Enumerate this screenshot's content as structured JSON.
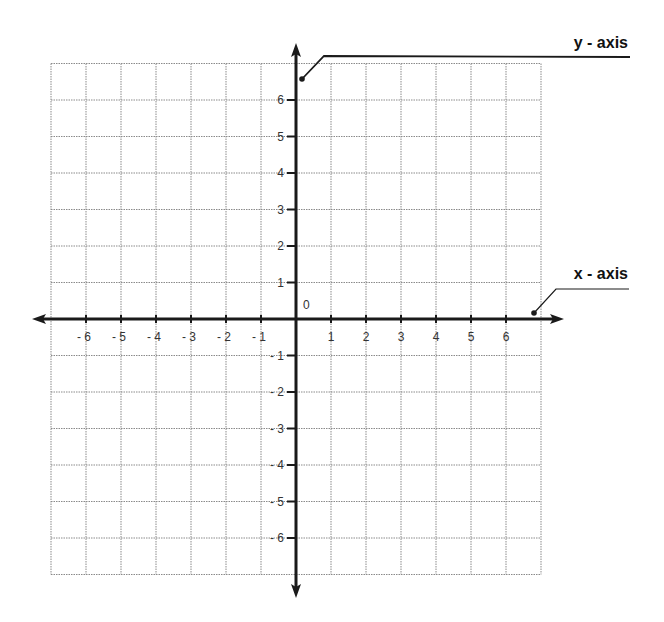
{
  "diagram": {
    "type": "coordinate-plane",
    "colors": {
      "grid": "#8a8a8a",
      "axis": "#1a1a1a",
      "text": "#333333",
      "background": "#ffffff"
    },
    "origin_label": "0",
    "x_axis": {
      "label": "x - axis",
      "ticks": [
        {
          "value": -6,
          "label": "- 6"
        },
        {
          "value": -5,
          "label": "- 5"
        },
        {
          "value": -4,
          "label": "- 4"
        },
        {
          "value": -3,
          "label": "- 3"
        },
        {
          "value": -2,
          "label": "- 2"
        },
        {
          "value": -1,
          "label": "- 1"
        },
        {
          "value": 1,
          "label": "1"
        },
        {
          "value": 2,
          "label": "2"
        },
        {
          "value": 3,
          "label": "3"
        },
        {
          "value": 4,
          "label": "4"
        },
        {
          "value": 5,
          "label": "5"
        },
        {
          "value": 6,
          "label": "6"
        }
      ],
      "range": [
        -7,
        7
      ]
    },
    "y_axis": {
      "label": "y - axis",
      "ticks": [
        {
          "value": 6,
          "label": "6"
        },
        {
          "value": 5,
          "label": "5"
        },
        {
          "value": 4,
          "label": "4"
        },
        {
          "value": 3,
          "label": "3"
        },
        {
          "value": 2,
          "label": "2"
        },
        {
          "value": 1,
          "label": "1"
        },
        {
          "value": -1,
          "label": "- 1"
        },
        {
          "value": -2,
          "label": "- 2"
        },
        {
          "value": -3,
          "label": "- 3"
        },
        {
          "value": -4,
          "label": "- 4"
        },
        {
          "value": -5,
          "label": "- 5"
        },
        {
          "value": -6,
          "label": "- 6"
        }
      ],
      "range": [
        -7,
        7
      ]
    }
  }
}
